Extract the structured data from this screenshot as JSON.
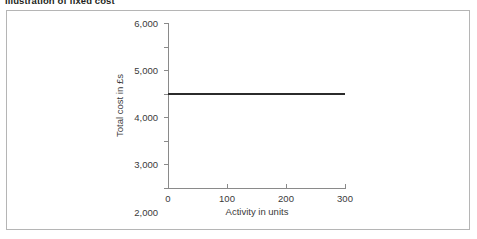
{
  "figure": {
    "title": "Illustration of fixed cost"
  },
  "chart_data": {
    "type": "line",
    "title": "Illustration of fixed cost",
    "xlabel": "Activity in units",
    "ylabel": "Total cost in £s",
    "grid": false,
    "legend": "none",
    "xlim": [
      0,
      300
    ],
    "ylim": [
      0,
      6000
    ],
    "x_ticks": [
      0,
      100,
      200,
      300
    ],
    "x_tick_labels": [
      "0",
      "100",
      "200",
      "300"
    ],
    "y_ticks": [
      0,
      1000,
      1500,
      2000,
      3000,
      4000,
      5000,
      6000
    ],
    "y_tick_labels": [
      "0",
      "1,000",
      "1,500",
      "2,000",
      "3,000",
      "4,000",
      "5,000",
      "6,000"
    ],
    "series": [
      {
        "name": "Fixed cost",
        "x": [
          0,
          300
        ],
        "values": [
          3000,
          3000
        ],
        "color": "#2b2b2b"
      }
    ],
    "annotations": []
  },
  "style": {
    "line_color": "#2b2b2b",
    "axis_color": "#8a8a8a",
    "frame_color": "#b5b5b5",
    "text_color": "#3a3a3a",
    "title_color": "#231f20",
    "background": "#ffffff"
  }
}
